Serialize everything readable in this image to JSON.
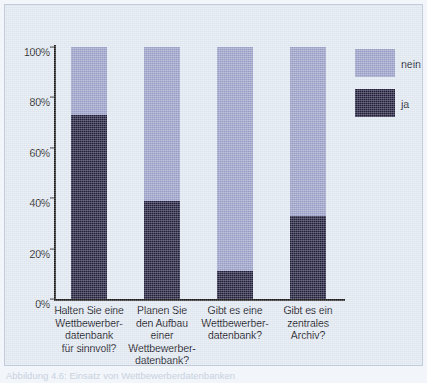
{
  "chart_data": {
    "type": "bar",
    "subtype": "stacked-100-percent",
    "title": "",
    "subtitle": "",
    "xlabel": "",
    "ylabel": "",
    "ylim": [
      0,
      100
    ],
    "yticks": [
      0,
      20,
      40,
      60,
      80,
      100
    ],
    "ytick_labels": [
      "0%",
      "20%",
      "40%",
      "60%",
      "80%",
      "100%"
    ],
    "grid": false,
    "legend_position": "right",
    "categories": [
      "Halten Sie eine Wettbewerber-datenbank für sinnvoll?",
      "Planen Sie den Aufbau einer Wettbewerber-datenbank?",
      "Gibt es eine Wettbewerber-datenbank?",
      "Gibt es ein zentrales Archiv?"
    ],
    "category_lines": [
      [
        "Halten Sie eine",
        "Wettbewerber-",
        "datenbank",
        "für sinnvoll?"
      ],
      [
        "Planen Sie",
        "den Aufbau",
        "einer",
        "Wettbewerber-",
        "datenbank?"
      ],
      [
        "Gibt es eine",
        "Wettbewerber-",
        "datenbank?"
      ],
      [
        "Gibt es ein",
        "zentrales",
        "Archiv?"
      ]
    ],
    "series": [
      {
        "name": "ja",
        "color": "#211e3c",
        "values": [
          73,
          39,
          11,
          33
        ]
      },
      {
        "name": "nein",
        "color": "#9aa0c8",
        "values": [
          27,
          61,
          89,
          67
        ]
      }
    ]
  },
  "legend": {
    "items": [
      {
        "label": "nein",
        "color": "#9aa0c8"
      },
      {
        "label": "ja",
        "color": "#211e3c"
      }
    ]
  },
  "axis": {
    "ytick_labels": [
      "100%",
      "80%",
      "60%",
      "40%",
      "20%",
      "0%"
    ]
  },
  "colors": {
    "series_nein": "#9aa0c8",
    "series_ja": "#211e3c",
    "background": "#e2e9f2",
    "axis": "#1a1a1a",
    "text": "#14141e"
  },
  "caption": {
    "text": "Abbildung 4.6: Einsatz von Wettbewerberdatenbanken"
  }
}
